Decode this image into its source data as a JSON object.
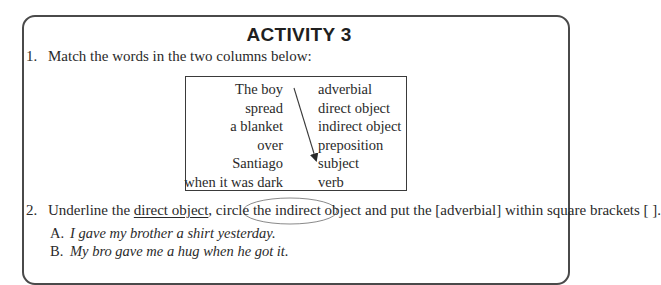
{
  "title": "ACTIVITY 3",
  "item1": {
    "number": "1.",
    "instruction": "Match the words in the two columns below:"
  },
  "match": {
    "left": [
      "The boy",
      "spread",
      "a blanket",
      "over",
      "Santiago",
      "when it was dark"
    ],
    "right": [
      "adverbial",
      "direct object",
      "indirect object",
      "preposition",
      "subject",
      "verb"
    ],
    "drawn_connection": {
      "from": "The boy",
      "to": "subject",
      "style": "arrow"
    }
  },
  "item2": {
    "number": "2.",
    "text_1": "Underline the ",
    "underlined": "direct object",
    "text_2": ", circle the ",
    "circled": "indirect object",
    "text_3": " and put the [adverbial] within square brackets [ ]."
  },
  "sentences": [
    {
      "letter": "A.",
      "text": "I gave my brother a shirt yesterday."
    },
    {
      "letter": "B.",
      "text": "My bro gave me a hug when he got it."
    }
  ],
  "colors": {
    "frame": "#4a4a4a",
    "text": "#2a2a2a",
    "ellipse": "#8a8a8a"
  }
}
